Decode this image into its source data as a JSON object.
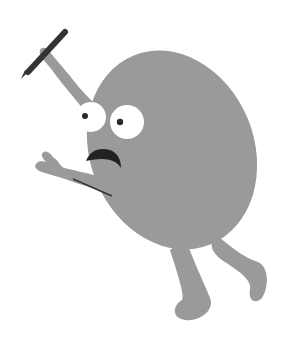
{
  "illustration": {
    "subject": "Gray round cartoon character holding a pen, looking startled",
    "colors": {
      "background": "#ffffff",
      "body": "#9a9a9a",
      "eye_white": "#ffffff",
      "pupil": "#2a2a2a",
      "mouth": "#222222",
      "pen": "#333333"
    }
  }
}
